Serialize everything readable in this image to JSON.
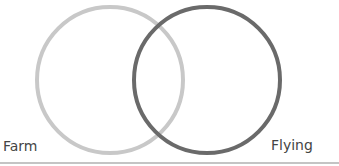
{
  "diagram": {
    "type": "venn",
    "sets": [
      {
        "id": "farm",
        "label_line1": "Farm",
        "label_line2": "animals",
        "stroke_color": "#c8c8c8",
        "cx": 110,
        "cy": 80,
        "r": 73
      },
      {
        "id": "flying",
        "label_line1": "Flying",
        "label_line2": "animals",
        "stroke_color": "#6a6a6a",
        "cx": 207,
        "cy": 80,
        "r": 73
      }
    ],
    "baseline_color": "#c4c4c4"
  }
}
